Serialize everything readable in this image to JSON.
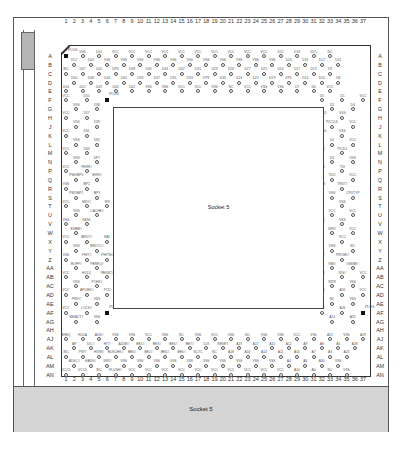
{
  "diagram": {
    "title": "Socket 5",
    "inner_label": "Socket 5",
    "bottom_label": "Socket 5",
    "column_numbers": [
      "1",
      "2",
      "3",
      "4",
      "5",
      "6",
      "7",
      "8",
      "9",
      "10",
      "11",
      "12",
      "13",
      "14",
      "15",
      "16",
      "17",
      "18",
      "19",
      "20",
      "21",
      "22",
      "23",
      "24",
      "25",
      "26",
      "27",
      "28",
      "29",
      "30",
      "31",
      "32",
      "33",
      "34",
      "35",
      "36",
      "37"
    ],
    "row_labels": [
      "A",
      "B",
      "C",
      "D",
      "E",
      "F",
      "G",
      "H",
      "J",
      "K",
      "L",
      "M",
      "N",
      "P",
      "Q",
      "R",
      "S",
      "T",
      "U",
      "V",
      "W",
      "X",
      "Y",
      "Z",
      "AA",
      "AB",
      "AC",
      "AD",
      "AE",
      "AF",
      "AG",
      "AH",
      "AJ",
      "AK",
      "AL",
      "AM",
      "AN"
    ],
    "plugs": [
      {
        "label": "PLUG",
        "col": 1,
        "row": "A"
      },
      {
        "label": "PLUG",
        "col": 6,
        "row": "H"
      },
      {
        "label": "PLUG",
        "col": 32,
        "row": "F"
      },
      {
        "label": "PLUG",
        "col": 6,
        "row": "AH"
      },
      {
        "label": "PLUG",
        "col": 32,
        "row": "AH"
      }
    ],
    "top_rows": [
      [
        "PLUG",
        "VSS",
        "D41",
        "VCC",
        "VCC",
        "VCC",
        "VCC",
        "VCC",
        "VCC",
        "VCC",
        "VCC",
        "VCC",
        "VCC",
        "D22",
        "D18",
        "D15",
        "NC"
      ],
      [
        "VCC",
        "D43",
        "VSS",
        "VSS",
        "VSS",
        "VSS",
        "VSS",
        "VSS",
        "VSS",
        "VSS",
        "VSS",
        "VSS",
        "VSS",
        "D20",
        "D16",
        "D12",
        "D11"
      ],
      [
        "INC",
        "D47",
        "D45",
        "DP4",
        "D38",
        "D36",
        "D34",
        "D32",
        "D31",
        "D29",
        "D28",
        "D27",
        "D25",
        "D24",
        "D17",
        "D13",
        "D9"
      ],
      [
        "D50",
        "D48",
        "D44",
        "D40",
        "D39",
        "D37",
        "D35",
        "D33",
        "DP3",
        "D30",
        "D26",
        "D21",
        "D19",
        "DP1",
        "D14",
        "D10",
        "D8"
      ],
      [
        "D54",
        "D52",
        "D49",
        "D46",
        "D42",
        "VSS",
        "VSS",
        "VCC",
        "VCC",
        "VSS",
        "NC",
        "VCC",
        "VSS",
        "VSS",
        "D7",
        "D6",
        "VCC"
      ]
    ],
    "left_cols": [
      [
        "VCC",
        "VSS",
        "D55",
        "D58",
        "PLUG"
      ],
      [
        "VCC",
        "VSS",
        "D57",
        "D59"
      ],
      [
        "VCC",
        "VSS",
        "D61",
        "D62"
      ],
      [
        "VCC",
        "VSS",
        "D63",
        "DP7"
      ],
      [
        "VCC",
        "PM0/BP0",
        "FERR#",
        "IERR#"
      ],
      [
        "VSS",
        "PM1/BP1",
        "BP2",
        "BP3"
      ],
      [
        "VCC",
        "VSS",
        "MI/O#",
        "CACHE#",
        "WV"
      ],
      [
        "VSS",
        "EWBE#",
        "KEN#"
      ],
      [
        "VCC",
        "VSS",
        "BRDY#",
        "BRDYC#",
        "NA#"
      ],
      [
        "VSS",
        "BOFF#",
        "PHIT#",
        "PBREQ#",
        "PHITM#"
      ],
      [
        "VCC",
        "VSS",
        "HOLD",
        "PCHK#",
        "PBGNT#"
      ],
      [
        "VCC",
        "PRDY",
        "APCHK#",
        "VSS",
        "PCD"
      ],
      [
        "VCC",
        "SMIACT#",
        "LOCK#",
        "VSS",
        "PLUG"
      ]
    ],
    "right_cols": [
      [
        "D5",
        "D2",
        "D1",
        "D4",
        "VCC"
      ],
      [
        "PICD1",
        "PICCLK",
        "VSS",
        "VCC"
      ],
      [
        "PICD0",
        "D0",
        "VSS",
        "VCC"
      ],
      [
        "VCC",
        "D3",
        "PICD1",
        "VSS"
      ],
      [
        "TCK",
        "TDO",
        "TDI",
        "VCC"
      ],
      [
        "TMS",
        "VSS",
        "TRST#",
        "CPUTYP"
      ],
      [
        "NC",
        "VCC",
        "VSS",
        "VCC"
      ],
      [
        "VCC",
        "W/R#",
        "VSS",
        "VCC"
      ],
      [
        "BF",
        "VSS",
        "VCC",
        "NC"
      ],
      [
        "INIT",
        "SMI#",
        "PRCHK#",
        "IGNNE#"
      ],
      [
        "NMI",
        "INTR",
        "R/S#",
        "VSS",
        "VCC"
      ],
      [
        "A20",
        "NC",
        "A31",
        "VSS",
        "VCC"
      ],
      [
        "A27",
        "A24",
        "A26",
        "A25",
        "PLUG"
      ]
    ],
    "bottom_rows": [
      [
        "BREQ",
        "HLDA",
        "ADS#",
        "VSS",
        "VSS",
        "VCC",
        "VSS",
        "NC",
        "VSS",
        "VCC",
        "VSS",
        "NC",
        "VSS",
        "VSS",
        "VCC",
        "VSS",
        "A21",
        "VSS",
        "A29",
        "VSS"
      ],
      [
        "AP",
        "D/C#",
        "HIT#",
        "A20M#",
        "BE1#",
        "BE3#",
        "BE4#",
        "BE7#",
        "CLK",
        "RESET",
        "A19",
        "A17",
        "A15",
        "A12",
        "A9",
        "A8",
        "A5",
        "A28",
        "A22"
      ],
      [
        "INC",
        "PWT",
        "HITM#",
        "BUSCHK#",
        "BE0#",
        "BE2#",
        "BE5#",
        "BE6#",
        "SCYC",
        "NC",
        "A18",
        "A16",
        "A14",
        "A11",
        "A10",
        "A7",
        "A3",
        "A23"
      ],
      [
        "ADSC#",
        "EADS#",
        "W/R#",
        "VSS",
        "VSS",
        "VSS",
        "VSS",
        "VSS",
        "VSS",
        "VSS",
        "VSS",
        "VSS",
        "VSS",
        "A4",
        "A6",
        "A30",
        "VSS"
      ],
      [
        "VCC5",
        "VCC5",
        "INC",
        "FLUSH#",
        "VCC",
        "VCC",
        "VCC",
        "VCC",
        "VCC",
        "VCC",
        "VCC",
        "VCC",
        "VCC",
        "VCC",
        "A10",
        "A6",
        "NC",
        "VSS"
      ]
    ],
    "colors": {
      "background": "#ffffff",
      "bottom_panel": "#d4d4d4",
      "slider": "#b5b5b5",
      "outline": "#333333",
      "plug_marker": "#111111"
    }
  }
}
